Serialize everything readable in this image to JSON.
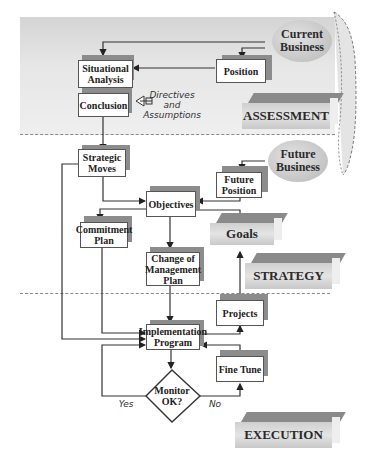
{
  "diagram": {
    "phases": {
      "assessment": "ASSESSMENT",
      "strategy": "STRATEGY",
      "execution": "EXECUTION"
    },
    "ellipses": {
      "current_business": "Current\nBusiness",
      "future_business": "Future\nBusiness"
    },
    "boxes": {
      "situational_analysis": "Situational\nAnalysis",
      "position": "Position",
      "conclusion": "Conclusion",
      "strategic_moves": "Strategic\nMoves",
      "future_position": "Future\nPosition",
      "objectives": "Objectives",
      "commitment_plan": "Commitment\nPlan",
      "change_of_management_plan": "Change of\nManagement\nPlan",
      "projects": "Projects",
      "implementation_program": "Implementation\nProgram",
      "fine_tune": "Fine Tune"
    },
    "goals": "Goals",
    "annotation": "Directives\nand\nAssumptions",
    "decision": {
      "label": "Monitor\nOK?",
      "yes": "Yes",
      "no": "No"
    },
    "colors": {
      "band": "#e0e0e0",
      "shadow": "#8c8c8c",
      "line": "#333333"
    }
  }
}
